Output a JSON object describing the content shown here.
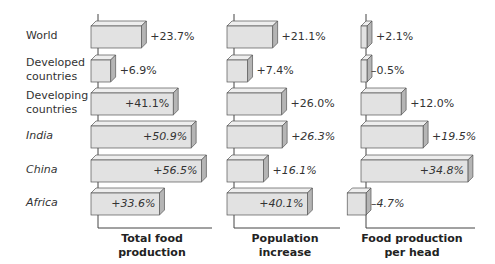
{
  "chart_data": {
    "type": "bar",
    "orientation": "horizontal",
    "style": "3d",
    "categories": [
      "World",
      "Developed countries",
      "Developing countries",
      "India",
      "China",
      "Africa"
    ],
    "category_italic": [
      false,
      false,
      false,
      true,
      true,
      true
    ],
    "series": [
      {
        "name": "Total food production",
        "values": [
          23.7,
          6.9,
          41.1,
          50.9,
          56.5,
          33.6
        ],
        "labels": [
          "+23.7%",
          "+6.9%",
          "+41.1%",
          "+50.9%",
          "+56.5%",
          "+33.6%"
        ],
        "label_inside": [
          false,
          false,
          true,
          true,
          true,
          true
        ]
      },
      {
        "name": "Population increase",
        "values": [
          21.1,
          7.4,
          26.0,
          26.3,
          16.1,
          40.1
        ],
        "labels": [
          "+21.1%",
          "+7.4%",
          "+26.0%",
          "+26.3%",
          "+16.1%",
          "+40.1%"
        ],
        "label_inside": [
          false,
          false,
          false,
          false,
          false,
          true
        ]
      },
      {
        "name": "Food production per head",
        "values": [
          2.1,
          -0.5,
          12.0,
          19.5,
          34.8,
          -4.7
        ],
        "labels": [
          "+2.1%",
          "–0.5%",
          "+12.0%",
          "+19.5%",
          "+34.8%",
          "–4.7%"
        ],
        "label_inside": [
          false,
          false,
          false,
          false,
          true,
          false
        ]
      }
    ],
    "xlabels": [
      [
        "Total food",
        "production"
      ],
      [
        "Population",
        "increase"
      ],
      [
        "Food production",
        "per head"
      ]
    ],
    "title": "",
    "colors": {
      "front": "#e2e2e2",
      "top": "#eeeeee",
      "side": "#b5b5b5",
      "edge": "#555555",
      "axis": "#444444"
    }
  }
}
